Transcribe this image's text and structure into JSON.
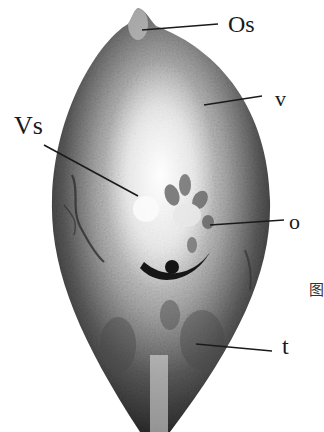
{
  "figure": {
    "labels": {
      "os": "Os",
      "v": "v",
      "vs": "Vs",
      "o": "o",
      "t": "t"
    },
    "caption_partial": "图",
    "colors": {
      "background": "#ffffff",
      "body_dark": "#2a2a2a",
      "body_mid": "#8a8a8a",
      "body_light": "#f2f2f2",
      "label_text": "#1a1a1a"
    }
  }
}
